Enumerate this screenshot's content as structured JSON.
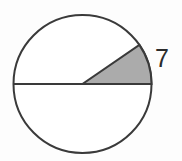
{
  "figure": {
    "kind": "circle-with-shaded-sector",
    "background_color": "#fdfdfd",
    "canvas": {
      "width": 182,
      "height": 161
    },
    "circle": {
      "name": "circle-outline",
      "center_x": 82.5,
      "center_y": 84,
      "radius": 69,
      "stroke_color": "#3a3a3a",
      "stroke_width": 2,
      "fill_color": "#ffffff"
    },
    "diameter": {
      "name": "horizontal-diameter",
      "x1": 13.5,
      "y1": 84,
      "x2": 151.5,
      "y2": 84,
      "stroke_color": "#3a3a3a",
      "stroke_width": 2
    },
    "sector": {
      "name": "shaded-sector",
      "start_angle_deg": 0,
      "end_angle_deg": 34.5,
      "fill_color": "#ababab",
      "stroke_color": "#3a3a3a",
      "stroke_width": 2
    },
    "labels": [
      {
        "name": "radius-label",
        "text": "7",
        "x": 155,
        "y": 45,
        "font_size": 25,
        "color": "#2b2b2b"
      }
    ]
  },
  "chart_data": {
    "type": "pie",
    "title": "",
    "xlabel": "",
    "ylabel": "",
    "categories": [
      "shaded sector",
      "unshaded remainder"
    ],
    "values": [
      34.5,
      325.5
    ],
    "value_unit": "degrees",
    "colors": [
      "#ababab",
      "#ffffff"
    ],
    "annotations": [
      {
        "text": "7",
        "meaning": "radius length",
        "position": "outside arc, right of sector"
      }
    ],
    "legend": "none",
    "grid": false
  }
}
